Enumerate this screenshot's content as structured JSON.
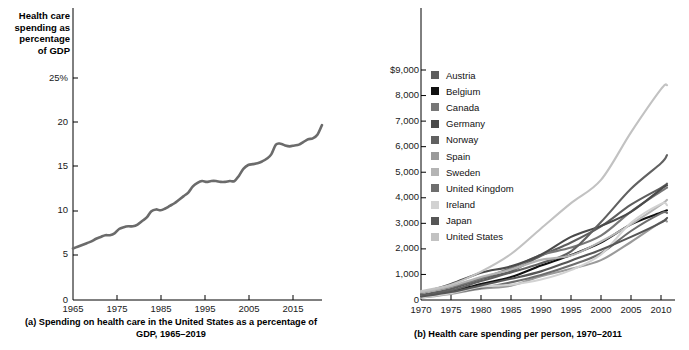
{
  "panel_a": {
    "axis_title": "Health care\nspending as\npercentage\nof GDP",
    "caption": "(a) Spending on health care in the United States as a percentage of GDP, 1965–2019",
    "y_ticks": [
      "25%",
      "20",
      "15",
      "10",
      "5",
      "0"
    ],
    "x_ticks": [
      "1965",
      "1975",
      "1985",
      "1995",
      "2005",
      "2015"
    ],
    "line_color": "#6b6b6b"
  },
  "panel_b": {
    "axis_title": "Health care\nspending\nper person",
    "caption": "(b) Health care spending per person, 1970–2011",
    "y_ticks": [
      "$9,000",
      "8,000",
      "7,000",
      "6,000",
      "5,000",
      "4,000",
      "3,000",
      "2,000",
      "1,000",
      "0"
    ],
    "x_ticks": [
      "1970",
      "1975",
      "1980",
      "1985",
      "1990",
      "1995",
      "2000",
      "2005",
      "2010"
    ],
    "legend": [
      {
        "label": "Austria",
        "color": "#5e5e5e"
      },
      {
        "label": "Belgium",
        "color": "#111111"
      },
      {
        "label": "Canada",
        "color": "#777777"
      },
      {
        "label": "Germany",
        "color": "#4a4a4a"
      },
      {
        "label": "Norway",
        "color": "#616161"
      },
      {
        "label": "Spain",
        "color": "#9a9a9a"
      },
      {
        "label": "Sweden",
        "color": "#b4b4b4"
      },
      {
        "label": "United Kingdom",
        "color": "#6e6e6e"
      },
      {
        "label": "Ireland",
        "color": "#d2d2d2"
      },
      {
        "label": "Japan",
        "color": "#565656"
      },
      {
        "label": "United States",
        "color": "#c2c2c2"
      }
    ]
  },
  "chart_data": [
    {
      "type": "line",
      "title": "(a) Spending on health care in the United States as a percentage of GDP, 1965–2019",
      "xlabel": "",
      "ylabel": "Health care spending as percentage of GDP",
      "xlim": [
        1965,
        2019
      ],
      "ylim": [
        0,
        27
      ],
      "y_ticks": [
        0,
        5,
        10,
        15,
        20,
        25
      ],
      "x_ticks": [
        1965,
        1975,
        1985,
        1995,
        2005,
        2015
      ],
      "grid": false,
      "legend": "none",
      "series": [
        {
          "name": "United States health care spending as % of GDP",
          "color": "#6b6b6b",
          "x": [
            1965,
            1966,
            1967,
            1968,
            1969,
            1970,
            1971,
            1972,
            1973,
            1974,
            1975,
            1976,
            1977,
            1978,
            1979,
            1980,
            1981,
            1982,
            1983,
            1984,
            1985,
            1986,
            1987,
            1988,
            1989,
            1990,
            1991,
            1992,
            1993,
            1994,
            1995,
            1996,
            1997,
            1998,
            1999,
            2000,
            2001,
            2002,
            2003,
            2004,
            2005,
            2006,
            2007,
            2008,
            2009,
            2010,
            2011,
            2012,
            2013,
            2014,
            2015,
            2016,
            2017,
            2018,
            2019
          ],
          "y": [
            5.8,
            6.0,
            6.2,
            6.4,
            6.6,
            6.9,
            7.1,
            7.3,
            7.3,
            7.5,
            8.0,
            8.2,
            8.3,
            8.3,
            8.5,
            8.9,
            9.3,
            10.0,
            10.2,
            10.1,
            10.3,
            10.6,
            10.9,
            11.3,
            11.7,
            12.1,
            12.8,
            13.2,
            13.4,
            13.3,
            13.4,
            13.4,
            13.3,
            13.3,
            13.4,
            13.4,
            14.0,
            14.8,
            15.2,
            15.3,
            15.4,
            15.6,
            15.9,
            16.4,
            17.5,
            17.6,
            17.4,
            17.3,
            17.4,
            17.5,
            17.8,
            18.1,
            18.2,
            18.6,
            19.7
          ]
        }
      ]
    },
    {
      "type": "line",
      "title": "(b) Health care spending per person, 1970–2011",
      "xlabel": "",
      "ylabel": "Health care spending per person",
      "xlim": [
        1970,
        2011
      ],
      "ylim": [
        0,
        9500
      ],
      "y_ticks": [
        0,
        1000,
        2000,
        3000,
        4000,
        5000,
        6000,
        7000,
        8000,
        9000
      ],
      "x_ticks": [
        1970,
        1975,
        1980,
        1985,
        1990,
        1995,
        2000,
        2005,
        2010
      ],
      "grid": false,
      "legend": "inside-upper-left",
      "x": [
        1970,
        1975,
        1980,
        1985,
        1990,
        1995,
        2000,
        2005,
        2010,
        2011
      ],
      "series": [
        {
          "name": "Austria",
          "color": "#5e5e5e",
          "values": [
            190,
            430,
            810,
            1130,
            1730,
            2250,
            2880,
            3730,
            4390,
            4550
          ]
        },
        {
          "name": "Belgium",
          "color": "#111111",
          "values": [
            150,
            330,
            630,
            900,
            1350,
            1760,
            2250,
            2960,
            3420,
            3510
          ]
        },
        {
          "name": "Canada",
          "color": "#777777",
          "values": [
            290,
            510,
            840,
            1250,
            1760,
            2050,
            2520,
            3460,
            4250,
            4400
          ]
        },
        {
          "name": "Germany",
          "color": "#4a4a4a",
          "values": [
            270,
            630,
            1070,
            1320,
            1770,
            2470,
            2900,
            3450,
            4340,
            4490
          ]
        },
        {
          "name": "Norway",
          "color": "#616161",
          "values": [
            150,
            370,
            740,
            1080,
            1440,
            1900,
            3050,
            4350,
            5350,
            5670
          ]
        },
        {
          "name": "Spain",
          "color": "#9a9a9a",
          "values": [
            90,
            240,
            440,
            560,
            930,
            1220,
            1560,
            2270,
            3050,
            3070
          ]
        },
        {
          "name": "Sweden",
          "color": "#b4b4b4",
          "values": [
            290,
            540,
            900,
            1190,
            1570,
            1740,
            2290,
            2960,
            3730,
            3920
          ]
        },
        {
          "name": "United Kingdom",
          "color": "#6e6e6e",
          "values": [
            160,
            280,
            470,
            690,
            980,
            1360,
            1830,
            2700,
            3390,
            3410
          ]
        },
        {
          "name": "Ireland",
          "color": "#d2d2d2",
          "values": [
            100,
            270,
            520,
            600,
            800,
            1170,
            1780,
            3020,
            3760,
            3710
          ]
        },
        {
          "name": "Japan",
          "color": "#565656",
          "values": [
            130,
            310,
            570,
            830,
            1120,
            1540,
            1970,
            2470,
            3030,
            3210
          ]
        },
        {
          "name": "United States",
          "color": "#c2c2c2",
          "values": [
            350,
            600,
            1110,
            1800,
            2800,
            3790,
            4700,
            6560,
            8250,
            8410
          ]
        }
      ]
    }
  ]
}
